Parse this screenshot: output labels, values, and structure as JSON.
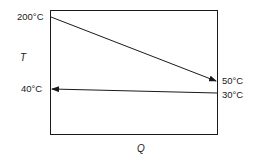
{
  "diagram": {
    "type": "temperature-heat-load (T-Q) diagram",
    "axis_labels": {
      "y": "T",
      "x": "Q"
    },
    "hot_stream": {
      "start_label": "200°C",
      "end_label": "50°C",
      "direction": "left-to-right"
    },
    "cold_stream": {
      "start_label": "30°C",
      "end_label": "40°C",
      "direction": "right-to-left"
    },
    "colors": {
      "line": "#1a1a1a",
      "background": "#ffffff"
    }
  }
}
